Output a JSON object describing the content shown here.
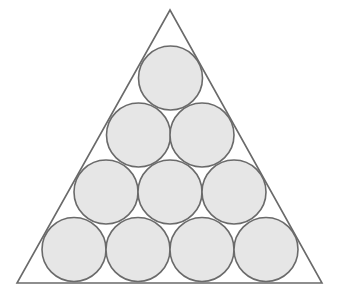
{
  "diagram": {
    "title": "",
    "colors": {
      "background": "#ffffff",
      "triangle_stroke": "#6a6a6a",
      "circle_fill": "#e6e6e6",
      "circle_stroke": "#6a6a6a"
    },
    "triangle": {
      "points": [
        [
          170,
          10
        ],
        [
          17,
          283
        ],
        [
          322,
          283
        ]
      ]
    },
    "circle_radius": 32,
    "rows": [
      {
        "count": 1,
        "cy": 78,
        "cx": [
          170.5
        ]
      },
      {
        "count": 2,
        "cy": 135,
        "cx": [
          138.5,
          202
        ]
      },
      {
        "count": 3,
        "cy": 192,
        "cx": [
          106,
          170,
          234
        ]
      },
      {
        "count": 4,
        "cy": 249.5,
        "cx": [
          74,
          138,
          202,
          266
        ]
      }
    ],
    "total_circles": 10
  }
}
